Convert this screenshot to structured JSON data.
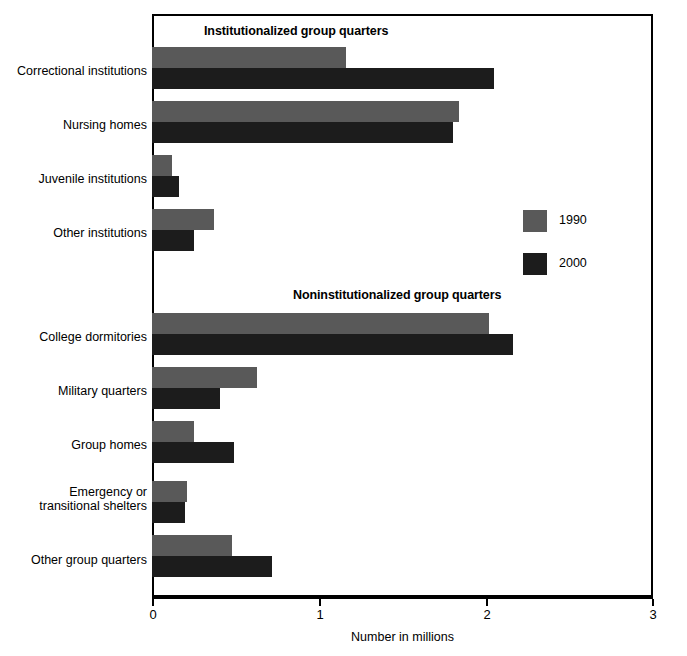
{
  "chart_data": {
    "type": "bar",
    "orientation": "horizontal",
    "title": "",
    "xlabel": "Number in millions",
    "ylabel": "",
    "xlim": [
      0,
      3
    ],
    "xticks": [
      "0",
      "1",
      "2",
      "3"
    ],
    "grid": false,
    "legend_position": "right",
    "series": [
      {
        "name": "1990",
        "color": "#595959",
        "values": [
          1.16,
          1.84,
          0.12,
          0.37,
          2.02,
          0.63,
          0.25,
          0.21,
          0.48
        ]
      },
      {
        "name": "2000",
        "color": "#1c1c1c",
        "values": [
          2.05,
          1.8,
          0.16,
          0.25,
          2.16,
          0.41,
          0.49,
          0.2,
          0.72
        ]
      }
    ],
    "categories": [
      "Correctional institutions",
      "Nursing homes",
      "Juvenile institutions",
      "Other institutions",
      "College dormitories",
      "Military quarters",
      "Group homes",
      "Emergency or transitional shelters",
      "Other group quarters"
    ],
    "group_headings": [
      "Institutionalized group quarters",
      "Noninstitutionalized group quarters"
    ]
  },
  "sections": {
    "institutionalized": "Institutionalized group quarters",
    "noninstitutionalized": "Noninstitutionalized group quarters"
  },
  "categories": {
    "correctional": "Correctional institutions",
    "nursing": "Nursing homes",
    "juvenile": "Juvenile institutions",
    "other_inst": "Other institutions",
    "college": "College dormitories",
    "military": "Military quarters",
    "group_homes": "Group homes",
    "shelters_line1": "Emergency or",
    "shelters_line2": "transitional shelters",
    "other_group": "Other group quarters"
  },
  "legend": {
    "series_1990": "1990",
    "series_2000": "2000",
    "color_1990": "#595959",
    "color_2000": "#1c1c1c"
  },
  "axis": {
    "title": "Number in millions",
    "tick_0": "0",
    "tick_1": "1",
    "tick_2": "2",
    "tick_3": "3"
  }
}
